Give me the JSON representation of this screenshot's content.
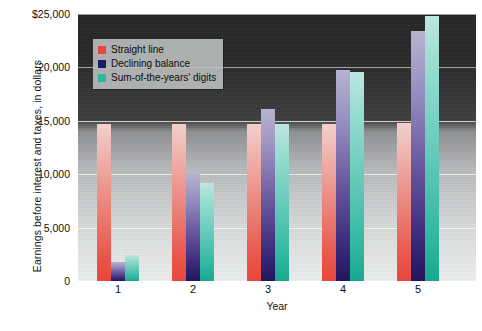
{
  "chart_data": {
    "type": "bar",
    "title": "",
    "xlabel": "Year",
    "ylabel": "Earnings before interest and taxes, in dollars",
    "categories": [
      "1",
      "2",
      "3",
      "4",
      "5"
    ],
    "ylim": [
      0,
      25000
    ],
    "ytick_labels": [
      "$25,000",
      "20,000",
      "15,000",
      "10,000",
      "5,000",
      "0"
    ],
    "ytick_values": [
      25000,
      20000,
      15000,
      10000,
      5000,
      0
    ],
    "grid": true,
    "legend_position": "upper-left-inside",
    "series": [
      {
        "name": "Straight line",
        "color": "#e8463c",
        "values": [
          14700,
          14700,
          14700,
          14700,
          14800
        ]
      },
      {
        "name": "Declining balance",
        "color": "#1a1a6e",
        "values": [
          1800,
          10100,
          16100,
          19800,
          23400
        ]
      },
      {
        "name": "Sum-of-the-years' digits",
        "color": "#2eb6a0",
        "values": [
          2400,
          9200,
          14700,
          19600,
          24800
        ]
      }
    ]
  },
  "axes": {
    "y_title": "Earnings before interest and taxes, in dollars",
    "x_title": "Year"
  },
  "legend": {
    "items": [
      {
        "label": "Straight line",
        "color": "#e8463c"
      },
      {
        "label": "Declining balance",
        "color": "#1a1a6e"
      },
      {
        "label": "Sum-of-the-years' digits",
        "color": "#2eb6a0"
      }
    ]
  }
}
